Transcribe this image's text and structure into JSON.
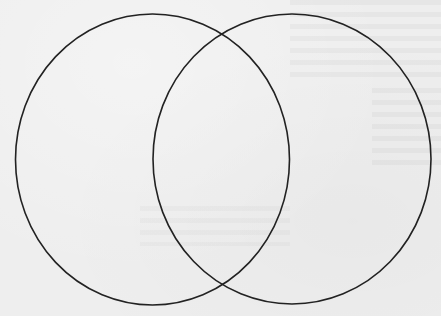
{
  "diagram": {
    "type": "venn",
    "set_count": 2,
    "stroke_color": "#222222",
    "background_color": "#eeeeee",
    "sets": [
      {
        "name": "left-set",
        "label": "",
        "cx": 152.5,
        "cy": 159.5,
        "rx": 137,
        "ry": 145.5
      },
      {
        "name": "right-set",
        "label": "",
        "cx": 292,
        "cy": 159,
        "rx": 139,
        "ry": 145
      }
    ],
    "intersection_label": ""
  }
}
